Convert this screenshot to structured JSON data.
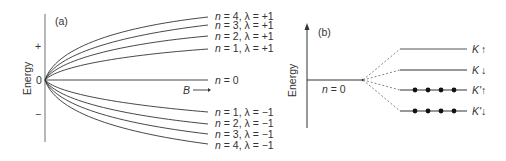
{
  "panel_a": {
    "label": "(a)",
    "y_axis_label": "Energy",
    "plus_sign": "+",
    "minus_sign": "−",
    "origin_label": "0",
    "x_axis_label": "B",
    "x_arrow": "→",
    "levels": [
      {
        "n": "4",
        "lambda": "+1",
        "text_n": "n",
        "text_rest": " = 4, λ = +1"
      },
      {
        "n": "3",
        "lambda": "+1",
        "text_n": "n",
        "text_rest": " = 3, λ = +1"
      },
      {
        "n": "2",
        "lambda": "+1",
        "text_n": "n",
        "text_rest": " = 2, λ = +1"
      },
      {
        "n": "1",
        "lambda": "+1",
        "text_n": "n",
        "text_rest": " = 1, λ = +1"
      },
      {
        "n": "0",
        "lambda": "",
        "text_n": "n",
        "text_rest": " = 0"
      },
      {
        "n": "1",
        "lambda": "−1",
        "text_n": "n",
        "text_rest": " = 1, λ = −1"
      },
      {
        "n": "2",
        "lambda": "−1",
        "text_n": "n",
        "text_rest": " = 2, λ = −1"
      },
      {
        "n": "3",
        "lambda": "−1",
        "text_n": "n",
        "text_rest": " = 3, λ = −1"
      },
      {
        "n": "4",
        "lambda": "−1",
        "text_n": "n",
        "text_rest": " = 4, λ = −1"
      }
    ]
  },
  "panel_b": {
    "label": "(b)",
    "y_axis_label": "Energy",
    "base_level": {
      "text_n": "n",
      "text_rest": " = 0"
    },
    "split_levels": [
      {
        "valley": "K",
        "spin": "↑",
        "filled": false
      },
      {
        "valley": "K",
        "spin": "↓",
        "filled": false
      },
      {
        "valley": "K'",
        "spin": "↑",
        "filled": true
      },
      {
        "valley": "K'",
        "spin": "↓",
        "filled": true
      }
    ]
  },
  "colors": {
    "line": "#333333",
    "axis": "#888888",
    "dashed": "#777777",
    "text": "#333333"
  }
}
